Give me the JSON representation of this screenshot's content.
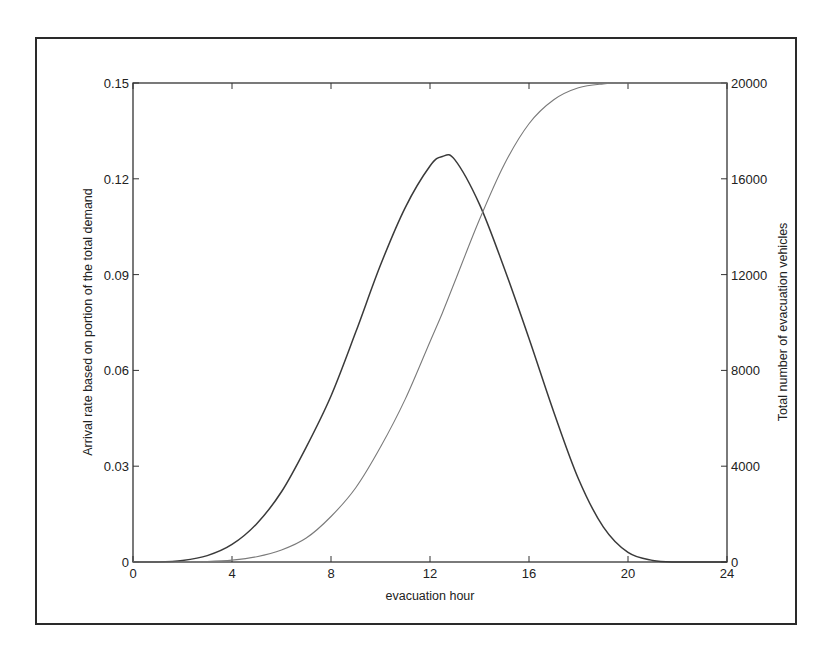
{
  "chart_data": {
    "type": "line",
    "title": "",
    "xlabel": "evacuation hour",
    "ylabel": "Arrival rate based on portion of the total demand",
    "ylabel_right": "Total number of evacuation vehicles",
    "xlim": [
      0,
      24
    ],
    "ylim": [
      0,
      0.15
    ],
    "ylim_right": [
      0,
      20000
    ],
    "grid": false,
    "legend": null,
    "x_ticks": [
      "0",
      "4",
      "8",
      "12",
      "16",
      "20",
      "24"
    ],
    "y_ticks": [
      "0",
      "0.03",
      "0.06",
      "0.09",
      "0.12",
      "0.15"
    ],
    "y_ticks_right": [
      "0",
      "4000",
      "8000",
      "12000",
      "16000",
      "20000"
    ],
    "x": [
      0,
      1,
      2,
      3,
      4,
      5,
      6,
      7,
      8,
      9,
      10,
      11,
      12,
      12.5,
      13,
      14,
      15,
      16,
      17,
      18,
      19,
      20,
      21,
      22,
      23,
      24
    ],
    "series": [
      {
        "name": "Arrival rate (left axis)",
        "axis": "left",
        "color": "#3a3a3a",
        "values": [
          0,
          0,
          0.0005,
          0.002,
          0.0055,
          0.012,
          0.022,
          0.036,
          0.052,
          0.072,
          0.093,
          0.111,
          0.124,
          0.127,
          0.126,
          0.112,
          0.092,
          0.07,
          0.047,
          0.026,
          0.011,
          0.003,
          0.0005,
          0,
          0,
          0
        ]
      },
      {
        "name": "Total number of evacuation vehicles (right axis)",
        "axis": "right",
        "color": "#7a7a7a",
        "values": [
          0,
          0,
          0,
          20,
          80,
          220,
          500,
          1000,
          1900,
          3100,
          4800,
          6800,
          9200,
          10400,
          11700,
          14300,
          16600,
          18300,
          19300,
          19800,
          19960,
          20000,
          20000,
          20000,
          20000,
          20000
        ]
      }
    ],
    "annotations": []
  }
}
